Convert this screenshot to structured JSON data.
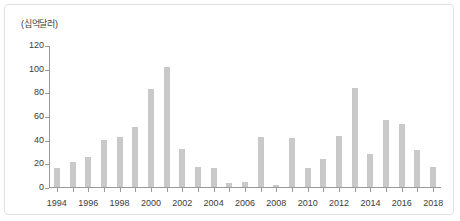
{
  "figure": {
    "y_unit_caption": "(십억달러)"
  },
  "chart_data": {
    "type": "bar",
    "title": "",
    "xlabel": "",
    "ylabel": "(십억달러)",
    "ylim": [
      0,
      120
    ],
    "ytick_values": [
      0,
      20,
      40,
      60,
      80,
      100,
      120
    ],
    "ytick_labels": [
      "0",
      "20",
      "40",
      "60",
      "80",
      "100",
      "120"
    ],
    "grid": false,
    "legend": null,
    "categories": [
      "1994",
      "1995",
      "1996",
      "1997",
      "1998",
      "1999",
      "2000",
      "2001",
      "2002",
      "2003",
      "2004",
      "2005",
      "2006",
      "2007",
      "2008",
      "2009",
      "2010",
      "2011",
      "2012",
      "2013",
      "2014",
      "2015",
      "2016",
      "2017",
      "2018"
    ],
    "values": [
      16,
      21,
      25,
      40,
      42,
      51,
      83,
      101,
      32,
      17,
      16,
      3,
      4,
      42,
      2,
      41,
      16,
      24,
      43,
      84,
      28,
      57,
      53,
      31,
      17
    ],
    "xtick_labels": [
      "1994",
      "1996",
      "1998",
      "2000",
      "2002",
      "2004",
      "2006",
      "2008",
      "2010",
      "2012",
      "2014",
      "2016",
      "2018"
    ],
    "bar_color": "#c9c9c9",
    "axis_color": "#9a9a9a",
    "text_color": "#3c3c3c"
  }
}
